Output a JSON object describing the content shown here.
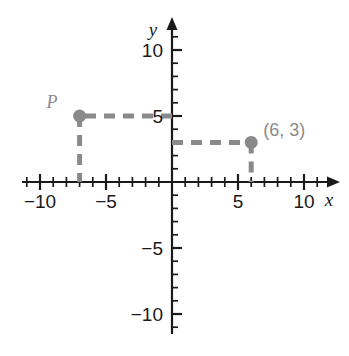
{
  "chart_data": {
    "type": "scatter",
    "title": "",
    "xlabel": "x",
    "ylabel": "y",
    "xlim": [
      -11,
      11
    ],
    "ylim": [
      -11,
      11
    ],
    "grid": false,
    "legend": "none",
    "x_ticks_labeled": [
      -10,
      -5,
      5,
      10
    ],
    "y_ticks_labeled": [
      10,
      5,
      -5,
      -10
    ],
    "x_tick_labels": [
      "−10",
      "−5",
      "5",
      "10"
    ],
    "y_tick_labels": [
      "10",
      "5",
      "−5",
      "−10"
    ],
    "minor_tick_interval": 1,
    "major_tick_interval": 5,
    "points": [
      {
        "name": "P",
        "label": "P",
        "x": -7,
        "y": 5,
        "label_dx": -22,
        "label_dy": -8,
        "guides": [
          "horizontal-to-y-axis",
          "vertical-to-x-axis"
        ]
      },
      {
        "name": "Q",
        "label": "(6, 3)",
        "x": 6,
        "y": 3,
        "label_dx": 12,
        "label_dy": -6,
        "guides": [
          "horizontal-to-y-axis",
          "vertical-to-x-axis"
        ]
      }
    ],
    "colors": {
      "axis": "#1a1a1a",
      "point": "#8a8a8a",
      "guide": "#8a8a8a",
      "label": "#8a8a8a",
      "tick_label": "#1a1a1a",
      "background": "#ffffff"
    }
  },
  "axes": {
    "y_axis_name": "y",
    "x_axis_name": "x"
  }
}
